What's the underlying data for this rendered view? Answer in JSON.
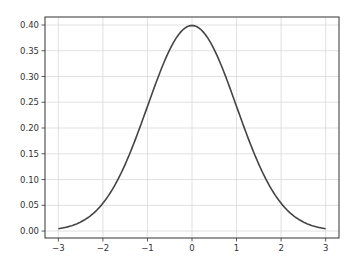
{
  "chart_data": {
    "type": "line",
    "title": "",
    "xlabel": "",
    "ylabel": "",
    "xlim": [
      -3.3,
      3.3
    ],
    "ylim": [
      -0.0135,
      0.4155
    ],
    "grid": true,
    "legend": null,
    "x_ticks": [
      -3,
      -2,
      -1,
      0,
      1,
      2,
      3
    ],
    "x_tick_labels": [
      "−3",
      "−2",
      "−1",
      "0",
      "1",
      "2",
      "3"
    ],
    "y_ticks": [
      0.0,
      0.05,
      0.1,
      0.15,
      0.2,
      0.25,
      0.3,
      0.35,
      0.4
    ],
    "y_tick_labels": [
      "0.00",
      "0.05",
      "0.10",
      "0.15",
      "0.20",
      "0.25",
      "0.30",
      "0.35",
      "0.40"
    ],
    "series": [
      {
        "name": "standard normal pdf",
        "color": "#444444",
        "x": [
          -3.0,
          -2.5,
          -2.0,
          -1.5,
          -1.0,
          -0.5,
          0.0,
          0.5,
          1.0,
          1.5,
          2.0,
          2.5,
          3.0
        ],
        "y": [
          0.0044,
          0.0175,
          0.054,
          0.1295,
          0.242,
          0.3521,
          0.3989,
          0.3521,
          0.242,
          0.1295,
          0.054,
          0.0175,
          0.0044
        ]
      }
    ]
  },
  "style": {
    "line_color": "#444444",
    "grid_color": "#d9d9d9",
    "axes_color": "#333333",
    "background": "#ffffff"
  }
}
